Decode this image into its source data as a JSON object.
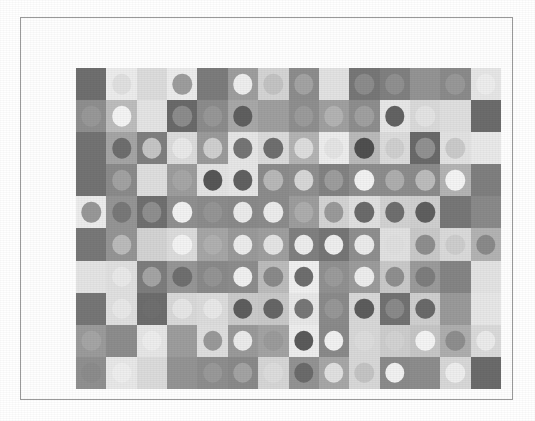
{
  "artwork": {
    "title": "Grayscale Op-Art Grid",
    "background_color": "#ffffff",
    "frame": {
      "border_color": "#9a9a9a",
      "fill_color": "#fefefe",
      "x": 20,
      "y": 17,
      "width": 493,
      "height": 383
    },
    "grid": {
      "x": 55,
      "y": 50,
      "width": 425,
      "height": 321,
      "columns": 14,
      "rows": 10,
      "cell_width": 30.4,
      "cell_height": 32.1,
      "dot_diameter_ratio": 0.64
    }
  },
  "chart_data": {
    "type": "heatmap",
    "xlabel": "",
    "ylabel": "",
    "grid": false,
    "legend": "none",
    "columns": 14,
    "rows": 10,
    "palette": [
      "#6f6f6f",
      "#7b7b7b",
      "#868686",
      "#8f8f8f",
      "#9a9a9a",
      "#a5a5a5",
      "#b0b0b0",
      "#bcbcbc",
      "#c7c7c7",
      "#d2d2d2",
      "#dedede",
      "#e8e8e8",
      "#f1f1f1",
      "#5e5e5e",
      "#565656"
    ],
    "cells": [
      [
        {
          "bg": "#6f6f6f",
          "dot": null
        },
        {
          "bg": "#ececec",
          "dot": "#e0e0e0"
        },
        {
          "bg": "#dcdcdc",
          "dot": null
        },
        {
          "bg": "#ececec",
          "dot": "#9d9d9d"
        },
        {
          "bg": "#7c7c7c",
          "dot": null
        },
        {
          "bg": "#9e9e9e",
          "dot": "#eeeeee"
        },
        {
          "bg": "#d4d4d4",
          "dot": "#c3c3c3"
        },
        {
          "bg": "#8d8d8d",
          "dot": "#a3a3a3"
        },
        {
          "bg": "#e2e2e2",
          "dot": null
        },
        {
          "bg": "#777777",
          "dot": "#8c8c8c"
        },
        {
          "bg": "#808080",
          "dot": "#909090"
        },
        {
          "bg": "#949494",
          "dot": null
        },
        {
          "bg": "#8b8b8b",
          "dot": "#989898"
        },
        {
          "bg": "#e6e6e6",
          "dot": "#ededed"
        }
      ],
      [
        {
          "bg": "#8f8f8f",
          "dot": "#989898"
        },
        {
          "bg": "#bdbdbd",
          "dot": "#f4f4f4"
        },
        {
          "bg": "#e4e4e4",
          "dot": null
        },
        {
          "bg": "#6a6a6a",
          "dot": "#8c8c8c"
        },
        {
          "bg": "#8c8c8c",
          "dot": "#979797"
        },
        {
          "bg": "#a8a8a8",
          "dot": "#5f5f5f"
        },
        {
          "bg": "#9f9f9f",
          "dot": null
        },
        {
          "bg": "#8f8f8f",
          "dot": "#9b9b9b"
        },
        {
          "bg": "#a0a0a0",
          "dot": "#b3b3b3"
        },
        {
          "bg": "#8e8e8e",
          "dot": "#a0a0a0"
        },
        {
          "bg": "#e7e7e7",
          "dot": "#636363"
        },
        {
          "bg": "#dadada",
          "dot": "#e3e3e3"
        },
        {
          "bg": "#dfdfdf",
          "dot": null
        },
        {
          "bg": "#6c6c6c",
          "dot": null
        }
      ],
      [
        {
          "bg": "#737373",
          "dot": null
        },
        {
          "bg": "#a5a5a5",
          "dot": "#6e6e6e"
        },
        {
          "bg": "#7f7f7f",
          "dot": "#c5c5c5"
        },
        {
          "bg": "#dcdcdc",
          "dot": "#e9e9e9"
        },
        {
          "bg": "#9b9b9b",
          "dot": "#cfcfcf"
        },
        {
          "bg": "#e6e6e6",
          "dot": "#757575"
        },
        {
          "bg": "#dbdbdb",
          "dot": "#6f6f6f"
        },
        {
          "bg": "#b4b4b4",
          "dot": "#dddddd"
        },
        {
          "bg": "#ededed",
          "dot": "#e4e4e4"
        },
        {
          "bg": "#bababa",
          "dot": "#4f4f4f"
        },
        {
          "bg": "#dcdcdc",
          "dot": "#cfcfcf"
        },
        {
          "bg": "#6a6a6a",
          "dot": "#919191"
        },
        {
          "bg": "#e2e2e2",
          "dot": "#cacaca"
        },
        {
          "bg": "#e9e9e9",
          "dot": null
        }
      ],
      [
        {
          "bg": "#737373",
          "dot": null
        },
        {
          "bg": "#8b8b8b",
          "dot": "#a2a2a2"
        },
        {
          "bg": "#dedede",
          "dot": null
        },
        {
          "bg": "#9d9d9d",
          "dot": "#a6a6a6"
        },
        {
          "bg": "#e3e3e3",
          "dot": "#575757"
        },
        {
          "bg": "#e6e6e6",
          "dot": "#616161"
        },
        {
          "bg": "#8c8c8c",
          "dot": "#b8b8b8"
        },
        {
          "bg": "#8f8f8f",
          "dot": "#d7d7d7"
        },
        {
          "bg": "#838383",
          "dot": "#9d9d9d"
        },
        {
          "bg": "#8e8e8e",
          "dot": "#f2f2f2"
        },
        {
          "bg": "#8d8d8d",
          "dot": "#aeaeae"
        },
        {
          "bg": "#8c8c8c",
          "dot": "#bcbcbc"
        },
        {
          "bg": "#b4b4b4",
          "dot": "#f4f4f4"
        },
        {
          "bg": "#7f7f7f",
          "dot": null
        }
      ],
      [
        {
          "bg": "#ececec",
          "dot": "#989898"
        },
        {
          "bg": "#959595",
          "dot": "#787878"
        },
        {
          "bg": "#707070",
          "dot": "#8f8f8f"
        },
        {
          "bg": "#909090",
          "dot": "#f2f2f2"
        },
        {
          "bg": "#8c8c8c",
          "dot": "#959595"
        },
        {
          "bg": "#8a8a8a",
          "dot": "#ebebeb"
        },
        {
          "bg": "#8c8c8c",
          "dot": "#ececec"
        },
        {
          "bg": "#9d9d9d",
          "dot": "#adadad"
        },
        {
          "bg": "#d3d3d3",
          "dot": "#9a9a9a"
        },
        {
          "bg": "#e0e0e0",
          "dot": "#6b6b6b"
        },
        {
          "bg": "#d2d2d2",
          "dot": "#6f6f6f"
        },
        {
          "bg": "#cfcfcf",
          "dot": "#5f5f5f"
        },
        {
          "bg": "#777777",
          "dot": null
        },
        {
          "bg": "#8a8a8a",
          "dot": null
        }
      ],
      [
        {
          "bg": "#787878",
          "dot": null
        },
        {
          "bg": "#959595",
          "dot": "#bbbbbb"
        },
        {
          "bg": "#d3d3d3",
          "dot": null
        },
        {
          "bg": "#dcdcdc",
          "dot": "#f3f3f3"
        },
        {
          "bg": "#a6a6a6",
          "dot": "#b0b0b0"
        },
        {
          "bg": "#9a9a9a",
          "dot": "#ececec"
        },
        {
          "bg": "#9f9f9f",
          "dot": "#e4e4e4"
        },
        {
          "bg": "#808080",
          "dot": "#ededed"
        },
        {
          "bg": "#767676",
          "dot": "#eeeeee"
        },
        {
          "bg": "#8f8f8f",
          "dot": "#ebebeb"
        },
        {
          "bg": "#e1e1e1",
          "dot": "#dfdfdf"
        },
        {
          "bg": "#c9c9c9",
          "dot": "#8e8e8e"
        },
        {
          "bg": "#dadada",
          "dot": "#cdcdcd"
        },
        {
          "bg": "#b3b3b3",
          "dot": "#8a8a8a"
        }
      ],
      [
        {
          "bg": "#e4e4e4",
          "dot": null
        },
        {
          "bg": "#e0e0e0",
          "dot": "#e9e9e9"
        },
        {
          "bg": "#7d7d7d",
          "dot": "#a4a4a4"
        },
        {
          "bg": "#969696",
          "dot": "#6f6f6f"
        },
        {
          "bg": "#8a8a8a",
          "dot": "#949494"
        },
        {
          "bg": "#8d8d8d",
          "dot": "#f0f0f0"
        },
        {
          "bg": "#bcbcbc",
          "dot": "#8a8a8a"
        },
        {
          "bg": "#f0f0f0",
          "dot": "#6e6e6e"
        },
        {
          "bg": "#919191",
          "dot": "#9b9b9b"
        },
        {
          "bg": "#9c9c9c",
          "dot": "#ededed"
        },
        {
          "bg": "#c9c9c9",
          "dot": "#8f8f8f"
        },
        {
          "bg": "#9b9b9b",
          "dot": "#7d7d7d"
        },
        {
          "bg": "#858585",
          "dot": null
        },
        {
          "bg": "#e3e3e3",
          "dot": null
        }
      ],
      [
        {
          "bg": "#767676",
          "dot": null
        },
        {
          "bg": "#e0e0e0",
          "dot": "#e8e8e8"
        },
        {
          "bg": "#6d6d6d",
          "dot": "#6f6f6f"
        },
        {
          "bg": "#d9d9d9",
          "dot": "#e6e6e6"
        },
        {
          "bg": "#dcdcdc",
          "dot": "#e8e8e8"
        },
        {
          "bg": "#cacaca",
          "dot": "#5e5e5e"
        },
        {
          "bg": "#c8c8c8",
          "dot": "#666666"
        },
        {
          "bg": "#e8e8e8",
          "dot": "#777777"
        },
        {
          "bg": "#8b8b8b",
          "dot": "#979797"
        },
        {
          "bg": "#d8d8d8",
          "dot": "#5d5d5d"
        },
        {
          "bg": "#727272",
          "dot": "#8a8a8a"
        },
        {
          "bg": "#cfcfcf",
          "dot": "#6a6a6a"
        },
        {
          "bg": "#9a9a9a",
          "dot": null
        },
        {
          "bg": "#e7e7e7",
          "dot": null
        }
      ],
      [
        {
          "bg": "#9b9b9b",
          "dot": "#a5a5a5"
        },
        {
          "bg": "#8d8d8d",
          "dot": null
        },
        {
          "bg": "#e6e6e6",
          "dot": "#ededed"
        },
        {
          "bg": "#9d9d9d",
          "dot": null
        },
        {
          "bg": "#dedede",
          "dot": "#999999"
        },
        {
          "bg": "#9a9a9a",
          "dot": "#ebebeb"
        },
        {
          "bg": "#a3a3a3",
          "dot": "#9b9b9b"
        },
        {
          "bg": "#ededed",
          "dot": "#5b5b5b"
        },
        {
          "bg": "#8a8a8a",
          "dot": "#f1f1f1"
        },
        {
          "bg": "#d8d8d8",
          "dot": "#dcdcdc"
        },
        {
          "bg": "#cdcdcd",
          "dot": "#d2d2d2"
        },
        {
          "bg": "#c6c6c6",
          "dot": "#f4f4f4"
        },
        {
          "bg": "#aeaeae",
          "dot": "#8e8e8e"
        },
        {
          "bg": "#dadada",
          "dot": "#ebebeb"
        }
      ],
      [
        {
          "bg": "#909090",
          "dot": "#8c8c8c"
        },
        {
          "bg": "#e8e8e8",
          "dot": "#eeeeee"
        },
        {
          "bg": "#dbdbdb",
          "dot": null
        },
        {
          "bg": "#949494",
          "dot": null
        },
        {
          "bg": "#8e8e8e",
          "dot": "#999999"
        },
        {
          "bg": "#8a8a8a",
          "dot": "#a3a3a3"
        },
        {
          "bg": "#d6d6d6",
          "dot": "#dcdcdc"
        },
        {
          "bg": "#939393",
          "dot": "#6b6b6b"
        },
        {
          "bg": "#a7a7a7",
          "dot": "#e0e0e0"
        },
        {
          "bg": "#d8d8d8",
          "dot": "#c4c4c4"
        },
        {
          "bg": "#8b8b8b",
          "dot": "#f1f1f1"
        },
        {
          "bg": "#8d8d8d",
          "dot": null
        },
        {
          "bg": "#d8d8d8",
          "dot": "#eeeeee"
        },
        {
          "bg": "#6b6b6b",
          "dot": null
        }
      ]
    ]
  }
}
